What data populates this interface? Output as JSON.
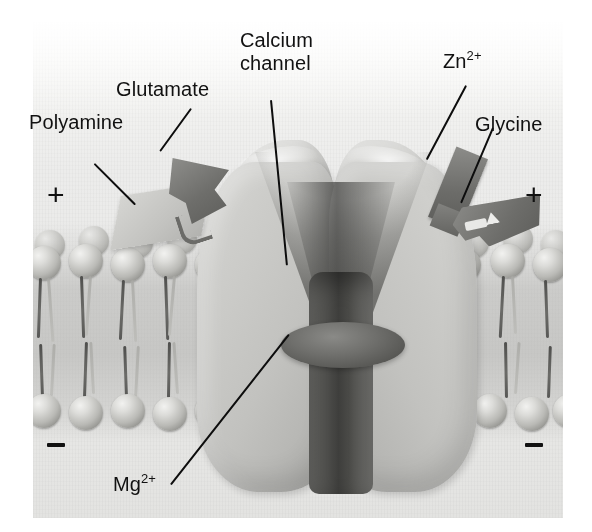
{
  "figure": {
    "background_color": "#ffffff",
    "panel_color": "#ebebe9"
  },
  "labels": {
    "polyamine": "Polyamine",
    "glutamate": "Glutamate",
    "calcium_channel_line1": "Calcium",
    "calcium_channel_line2": "channel",
    "zinc": "Zn",
    "zinc_charge": "2+",
    "glycine": "Glycine",
    "magnesium": "Mg",
    "magnesium_charge": "2+"
  },
  "charges": {
    "outside_left": "+",
    "outside_right": "+",
    "inside_left": "−",
    "inside_right": "−"
  },
  "structures": {
    "receptor": "ligand-gated ion channel protein",
    "membrane": "phospholipid bilayer",
    "pore_blocker": "Mg2+ block in pore",
    "ligand_polyamine": "polyamine modulatory site",
    "ligand_glutamate": "glutamate binding site",
    "ligand_zinc": "zinc binding site",
    "ligand_glycine": "glycine co-agonist site"
  },
  "colors": {
    "text": "#111111",
    "leader_line": "#0d0d0d",
    "protein_light": "#cdcdca",
    "protein_dark": "#a7a7a4",
    "pore_dark": "#3e3e3c",
    "ligand_dark": "#6d6d6a",
    "ligand_light": "#c2c2bf",
    "lipid_head": "#b9b9b5",
    "lipid_tail": "#5a5a57"
  }
}
